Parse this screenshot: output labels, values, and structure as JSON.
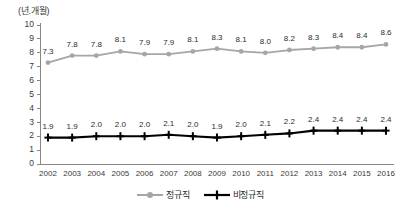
{
  "chart_data": {
    "type": "line",
    "title": "",
    "subtitle": "",
    "xlabel": "",
    "ylabel": "(년.개월)",
    "unit_label": "(년.개월)",
    "ylim": [
      0,
      10
    ],
    "ytick_step": 1,
    "yticks": [
      "10",
      "9",
      "8",
      "7",
      "6",
      "5",
      "4",
      "3",
      "2",
      "1",
      "0"
    ],
    "grid": false,
    "legend_position": "bottom-center",
    "categories": [
      "2002",
      "2003",
      "2004",
      "2005",
      "2006",
      "2007",
      "2008",
      "2009",
      "2010",
      "2011",
      "2012",
      "2013",
      "2014",
      "2015",
      "2016"
    ],
    "series": [
      {
        "name": "정규직",
        "color": "#a6a6a6",
        "marker": "circle",
        "values": [
          7.3,
          7.8,
          7.8,
          8.1,
          7.9,
          7.9,
          8.1,
          8.3,
          8.1,
          8.0,
          8.2,
          8.3,
          8.4,
          8.4,
          8.6
        ],
        "labels": [
          "7.3",
          "7.8",
          "7.8",
          "8.1",
          "7.9",
          "7.9",
          "8.1",
          "8.3",
          "8.1",
          "8.0",
          "8.2",
          "8.3",
          "8.4",
          "8.4",
          "8.6"
        ]
      },
      {
        "name": "비정규직",
        "color": "#000000",
        "marker": "plus",
        "values": [
          1.9,
          1.9,
          2.0,
          2.0,
          2.0,
          2.1,
          2.0,
          1.9,
          2.0,
          2.1,
          2.2,
          2.4,
          2.4,
          2.4,
          2.4
        ],
        "labels": [
          "1.9",
          "1.9",
          "2.0",
          "2.0",
          "2.0",
          "2.1",
          "2.0",
          "1.9",
          "2.0",
          "2.1",
          "2.2",
          "2.4",
          "2.4",
          "2.4",
          "2.4"
        ]
      }
    ]
  },
  "legend": {
    "items": [
      {
        "label": "정규직",
        "color": "#a6a6a6"
      },
      {
        "label": "비정규직",
        "color": "#000000"
      }
    ]
  }
}
